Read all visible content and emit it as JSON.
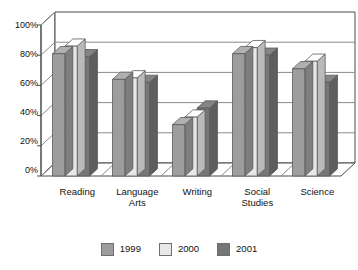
{
  "chart_data": {
    "type": "bar",
    "title": "",
    "xlabel": "",
    "ylabel": "",
    "ylim": [
      0,
      100
    ],
    "ytick_labels": [
      "0%",
      "20%",
      "40%",
      "60%",
      "80%",
      "100%"
    ],
    "ytick_values": [
      0,
      20,
      40,
      60,
      80,
      100
    ],
    "grid": true,
    "legend_position": "bottom",
    "three_d": true,
    "categories": [
      "Reading",
      "Language\nArts",
      "Writing",
      "Social\nStudies",
      "Science"
    ],
    "series": [
      {
        "name": "1999",
        "color": "#9d9d9d",
        "values": [
          81,
          64,
          34,
          81,
          71
        ]
      },
      {
        "name": "2000",
        "color": "#e8e8e8",
        "values": [
          86,
          65,
          39,
          85,
          76
        ]
      },
      {
        "name": "2001",
        "color": "#767676",
        "values": [
          79,
          62,
          45,
          80,
          62
        ]
      }
    ]
  },
  "axis": {
    "tick_0": "0%",
    "tick_20": "20%",
    "tick_40": "40%",
    "tick_60": "60%",
    "tick_80": "80%",
    "tick_100": "100%"
  },
  "categories": {
    "c0": "Reading",
    "c1": "Language\nArts",
    "c2": "Writing",
    "c3": "Social\nStudies",
    "c4": "Science"
  },
  "legend": {
    "items": [
      {
        "label": "1999"
      },
      {
        "label": "2000"
      },
      {
        "label": "2001"
      }
    ]
  },
  "colors": {
    "series_1999": "#9d9d9d",
    "series_2000": "#e8e8e8",
    "series_2001": "#767676",
    "axis_line": "#4a4a4a",
    "grid_line": "#8a8a8a",
    "background": "#ffffff"
  }
}
